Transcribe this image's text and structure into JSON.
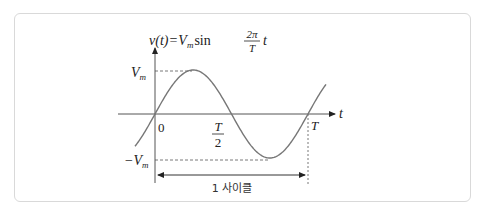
{
  "diagram": {
    "type": "sine-wave",
    "formula": {
      "lhs": "v(t)",
      "equals": "=",
      "amp": "V",
      "amp_sub": "m",
      "func": "sin",
      "frac_num": "2π",
      "frac_den": "T",
      "var": "t"
    },
    "axis_label_t": "t",
    "labels": {
      "vm": "V",
      "vm_sub": "m",
      "neg_vm": "−V",
      "neg_vm_sub": "m",
      "zero": "0",
      "half_num": "T",
      "half_den": "2",
      "period": "T"
    },
    "cycle_label": "1 사이클",
    "colors": {
      "curve": "#777777",
      "axis": "#555555",
      "text": "#222222",
      "border": "#d9d9d9"
    }
  }
}
